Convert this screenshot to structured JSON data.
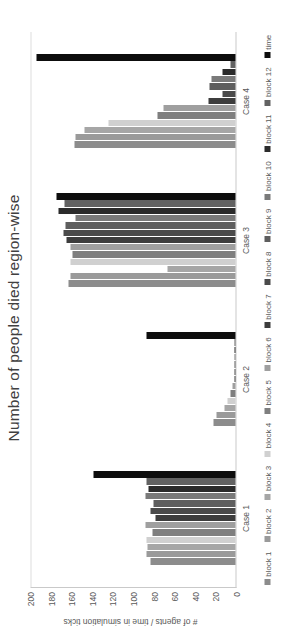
{
  "chart_data": {
    "type": "bar",
    "orientation": "horizontal-rotated",
    "title": "Number of people died region-wise",
    "xlabel": "",
    "ylabel": "# of agents / time in simulation ticks",
    "ylim": [
      0,
      200
    ],
    "yticks": [
      200,
      180,
      160,
      140,
      120,
      100,
      80,
      60,
      40,
      20,
      0
    ],
    "grid": true,
    "legend_position": "bottom",
    "categories": [
      "Case 1",
      "Case 2",
      "Case 3",
      "Case 4"
    ],
    "series": [
      {
        "name": "block 1",
        "color": "#8c8c8c",
        "values": [
          83,
          21,
          162,
          156
        ]
      },
      {
        "name": "block 2",
        "color": "#9a9a9a",
        "values": [
          86,
          18,
          160,
          155
        ]
      },
      {
        "name": "block 3",
        "color": "#a6a6a6",
        "values": [
          85,
          11,
          66,
          147
        ]
      },
      {
        "name": "block 4",
        "color": "#d0d0d0",
        "values": [
          86,
          8,
          160,
          123
        ]
      },
      {
        "name": "block 5",
        "color": "#7f7f7f",
        "values": [
          81,
          5,
          158,
          76
        ]
      },
      {
        "name": "block 6",
        "color": "#9f9f9f",
        "values": [
          87,
          3,
          160,
          70
        ]
      },
      {
        "name": "block 7",
        "color": "#3d3d3d",
        "values": [
          78,
          1,
          164,
          26
        ]
      },
      {
        "name": "block 8",
        "color": "#4a4a4a",
        "values": [
          83,
          1,
          167,
          13
        ]
      },
      {
        "name": "block 9",
        "color": "#5e5e5e",
        "values": [
          80,
          1,
          165,
          25
        ]
      },
      {
        "name": "block 10",
        "color": "#7a7a7a",
        "values": [
          87,
          1,
          155,
          23
        ]
      },
      {
        "name": "block 11",
        "color": "#2b2b2b",
        "values": [
          84,
          1,
          172,
          13
        ]
      },
      {
        "name": "block 12",
        "color": "#626262",
        "values": [
          86,
          1,
          166,
          5
        ]
      },
      {
        "name": "time",
        "color": "#0d0d0d",
        "values": [
          138,
          86,
          174,
          193
        ]
      }
    ]
  },
  "legend": {
    "items": [
      "block 1",
      "block 2",
      "block 3",
      "block 4",
      "block 5",
      "block 6",
      "block 7",
      "block 8",
      "block 9",
      "block 10",
      "block 11",
      "block 12",
      "time"
    ]
  }
}
